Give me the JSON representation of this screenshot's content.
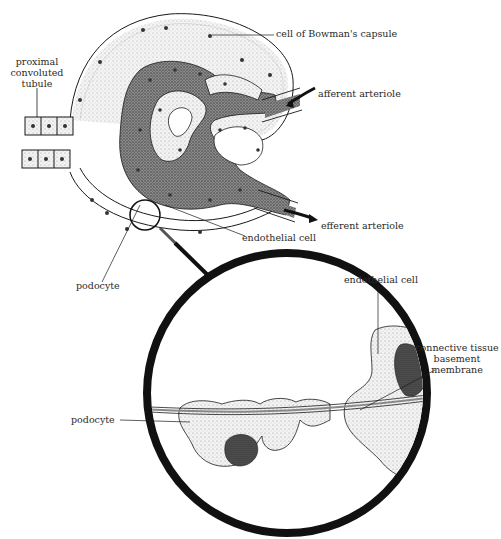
{
  "diagram": {
    "colors": {
      "ink": "#1a1a1a",
      "stipple_light": "#d9d9d9",
      "stipple_dark": "#6e6e6e",
      "background": "#ffffff"
    },
    "labels": {
      "bowman": "cell of Bowman's capsule",
      "pct_line1": "proximal",
      "pct_line2": "convoluted",
      "pct_line3": "tubule",
      "afferent": "afferent arteriole",
      "efferent": "efferent arteriole",
      "endothelial_top": "endothelial cell",
      "podocyte_top": "podocyte",
      "endothelial_detail": "endothelial cell",
      "ct_line1": "connective tissue",
      "ct_line2": "basement",
      "ct_line3": "membrane",
      "podocyte_detail": "podocyte"
    }
  }
}
